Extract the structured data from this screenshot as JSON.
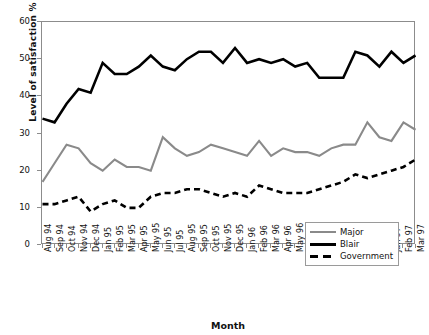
{
  "chart_data": {
    "type": "line",
    "title": "",
    "xlabel": "Month",
    "ylabel": "Level of satisfaction %",
    "ylim": [
      0,
      60
    ],
    "yticks": [
      0,
      10,
      20,
      30,
      40,
      50,
      60
    ],
    "grid": false,
    "legend_position": "bottom-right",
    "categories": [
      "Aug 94",
      "Sep 94",
      "Oct 94",
      "Nov 94",
      "Dec 94",
      "Jan 95",
      "Feb 95",
      "Mar 95",
      "Apr 95",
      "May 95",
      "Jun 95",
      "Jul 95",
      "Aug 95",
      "Sep 95",
      "Oct 95",
      "Nov 95",
      "Dec 95",
      "Jan 96",
      "Feb 96",
      "Mar 96",
      "Apr 96",
      "May 96",
      "Jun 96",
      "Jul 96",
      "Aug 96",
      "Sep 96",
      "Oct 96",
      "Nov 96",
      "Dec 96",
      "Jan 97",
      "Feb 97",
      "Mar 97"
    ],
    "series": [
      {
        "name": "Major",
        "color": "#8a8a8a",
        "style": "solid",
        "values": [
          17,
          22,
          27,
          26,
          22,
          20,
          23,
          21,
          21,
          20,
          29,
          26,
          24,
          25,
          27,
          26,
          25,
          24,
          28,
          24,
          26,
          25,
          25,
          24,
          26,
          27,
          27,
          33,
          29,
          28,
          33,
          31
        ]
      },
      {
        "name": "Blair",
        "color": "#000000",
        "style": "solid",
        "values": [
          34,
          33,
          38,
          42,
          41,
          49,
          46,
          46,
          48,
          51,
          48,
          47,
          50,
          52,
          52,
          49,
          53,
          49,
          50,
          49,
          50,
          48,
          49,
          45,
          45,
          45,
          52,
          51,
          48,
          52,
          49,
          51
        ]
      },
      {
        "name": "Government",
        "color": "#000000",
        "style": "dashed",
        "values": [
          11,
          11,
          12,
          13,
          9,
          11,
          12,
          10,
          10,
          13,
          14,
          14,
          15,
          15,
          14,
          13,
          14,
          13,
          16,
          15,
          14,
          14,
          14,
          15,
          16,
          17,
          19,
          18,
          19,
          20,
          21,
          23
        ]
      }
    ]
  },
  "legend": {
    "items": [
      {
        "label": "Major"
      },
      {
        "label": "Blair"
      },
      {
        "label": "Government"
      }
    ]
  }
}
